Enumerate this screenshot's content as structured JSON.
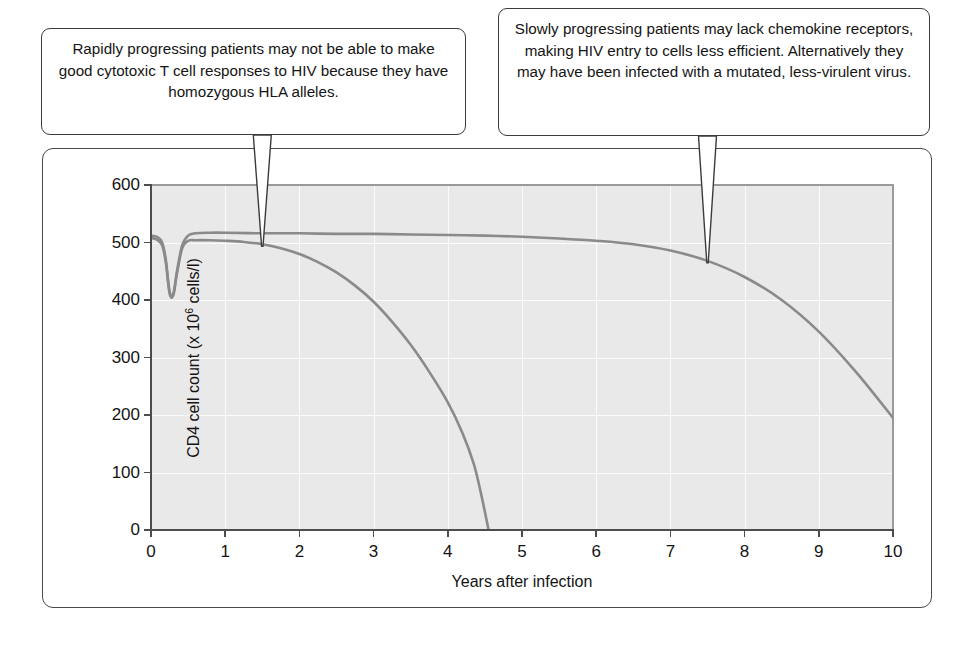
{
  "callouts": {
    "left": {
      "text": "Rapidly progressing patients may not be able to make good cytotoxic T cell responses to HIV because they have homozygous HLA alleles.",
      "points_to_series": "rapid-progressors",
      "points_to_year": 1.5
    },
    "right": {
      "text": "Slowly progressing patients may lack chemokine receptors, making HIV entry to cells less efficient. Alternatively they may have been infected with a mutated, less-virulent virus.",
      "points_to_series": "slow-progressors",
      "points_to_year": 7.5
    }
  },
  "chart_data": {
    "type": "line",
    "title": "",
    "xlabel": "Years after infection",
    "ylabel": "CD4 cell count (x 10⁶ cells/l)",
    "ylabel_prefix": "CD4 cell count (x 10",
    "ylabel_exponent": "6",
    "ylabel_suffix": " cells/l)",
    "xlim": [
      0,
      10
    ],
    "ylim": [
      0,
      600
    ],
    "xticks": [
      0,
      1,
      2,
      3,
      4,
      5,
      6,
      7,
      8,
      9,
      10
    ],
    "xtick_labels": [
      "0",
      "1",
      "2",
      "3",
      "4",
      "5",
      "6",
      "7",
      "8",
      "9",
      "10"
    ],
    "yticks": [
      0,
      100,
      200,
      300,
      400,
      500,
      600
    ],
    "ytick_labels": [
      "0",
      "100",
      "200",
      "300",
      "400",
      "500",
      "600"
    ],
    "grid": true,
    "grid_color": "#fbfbfb",
    "plot_background": "#e9e9e9",
    "legend": "none",
    "curve_color": "#8a8a8a",
    "series": [
      {
        "name": "slow-progressors",
        "label": "Slowly progressing patients",
        "x": [
          0,
          0.08,
          0.15,
          0.2,
          0.25,
          0.3,
          0.35,
          0.42,
          0.5,
          0.6,
          0.8,
          1.0,
          1.5,
          2.0,
          2.5,
          3.0,
          3.5,
          4.0,
          4.5,
          5.0,
          5.5,
          6.0,
          6.5,
          7.0,
          7.5,
          8.0,
          8.5,
          9.0,
          9.5,
          10.0
        ],
        "y": [
          512,
          510,
          500,
          470,
          415,
          410,
          450,
          495,
          512,
          516,
          517,
          517,
          516,
          516,
          515,
          515,
          514,
          513,
          512,
          510,
          507,
          503,
          497,
          486,
          468,
          440,
          400,
          345,
          275,
          195
        ]
      },
      {
        "name": "rapid-progressors",
        "label": "Rapidly progressing patients",
        "x": [
          0,
          0.08,
          0.15,
          0.2,
          0.25,
          0.3,
          0.35,
          0.42,
          0.5,
          0.6,
          0.8,
          1.0,
          1.25,
          1.5,
          1.75,
          2.0,
          2.25,
          2.5,
          2.75,
          3.0,
          3.25,
          3.5,
          3.75,
          4.0,
          4.2,
          4.35,
          4.45,
          4.55
        ],
        "y": [
          508,
          505,
          495,
          465,
          412,
          408,
          446,
          490,
          503,
          504,
          504,
          503,
          501,
          497,
          490,
          480,
          466,
          448,
          425,
          397,
          362,
          322,
          275,
          222,
          168,
          115,
          62,
          0
        ]
      }
    ]
  }
}
